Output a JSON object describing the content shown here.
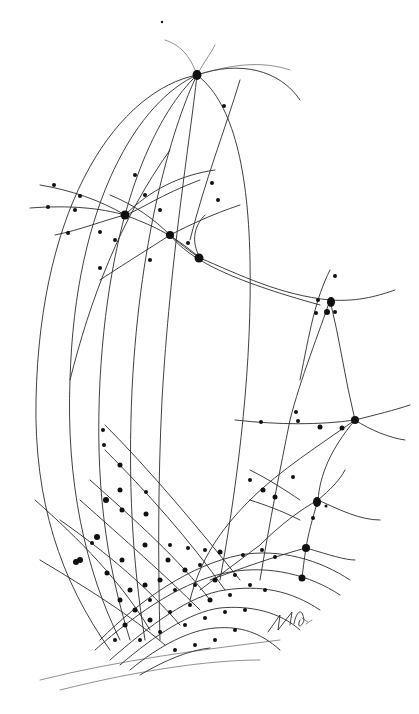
{
  "artwork": {
    "description": "Pen-and-ink drawing of a curved line network with nodes",
    "background": "#ffffff",
    "ink": "#111111",
    "signature_text": "MG 07"
  }
}
